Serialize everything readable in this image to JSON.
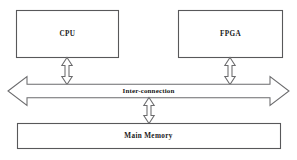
{
  "diagram": {
    "background_color": "#ffffff",
    "line_color": "#58585a",
    "text_color": "#1a1a1a",
    "nodes": [
      {
        "id": "cpu",
        "label": "CPU",
        "x": 16,
        "y": 10,
        "w": 102,
        "h": 47
      },
      {
        "id": "fpga",
        "label": "FPGA",
        "x": 178,
        "y": 10,
        "w": 105,
        "h": 47
      },
      {
        "id": "main_memory",
        "label": "Main  Memory",
        "x": 17,
        "y": 123,
        "w": 264,
        "h": 25
      }
    ],
    "bus": {
      "id": "interconnection",
      "label": "Inter-connection",
      "orientation": "horizontal",
      "double_headed": true,
      "left_tip_x": 8,
      "right_tip_x": 289,
      "center_y": 91
    },
    "connectors": [
      {
        "id": "cpu-to-bus",
        "from": "cpu",
        "to": "interconnection",
        "double_headed": true,
        "orientation": "vertical",
        "center_x": 67,
        "top_y": 57,
        "bottom_y": 84
      },
      {
        "id": "fpga-to-bus",
        "from": "fpga",
        "to": "interconnection",
        "double_headed": true,
        "orientation": "vertical",
        "center_x": 230,
        "top_y": 57,
        "bottom_y": 84
      },
      {
        "id": "bus-to-main-memory",
        "from": "interconnection",
        "to": "main_memory",
        "double_headed": true,
        "orientation": "vertical",
        "center_x": 149,
        "top_y": 98,
        "bottom_y": 123
      }
    ]
  }
}
